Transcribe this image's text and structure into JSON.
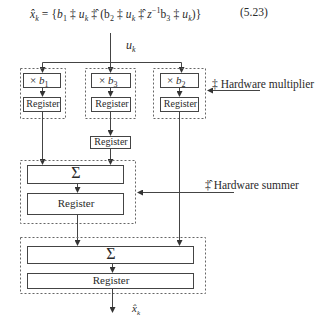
{
  "equation": {
    "lhs": "x̂",
    "lhs_sub": "k",
    "body_parts": [
      "{",
      "b",
      "1",
      " ‡ ",
      "u",
      "k",
      " ‡̂ (b",
      "2",
      " ‡ ",
      "u",
      "k",
      " ‡̂ ",
      "z",
      "−1",
      "b",
      "3",
      " ‡ ",
      "u",
      "k",
      ")}"
    ],
    "text": "x̂k = {b1 ‡ uk ‡̂ (b2 ‡ uk ‡̂ z−1b3 ‡ uk)}",
    "number": "(5.23)"
  },
  "diagram": {
    "input_label": "u",
    "input_sub": "k",
    "output_label": "x̂",
    "output_sub": "k",
    "multipliers": [
      {
        "op": "×",
        "coef": "b",
        "sub": "1",
        "register": "Register"
      },
      {
        "op": "×",
        "coef": "b",
        "sub": "3",
        "register": "Register",
        "extra_register": "Register"
      },
      {
        "op": "×",
        "coef": "b",
        "sub": "2",
        "register": "Register"
      }
    ],
    "summer1": {
      "symbol": "Σ",
      "register": "Register"
    },
    "summer2": {
      "symbol": "Σ",
      "register": "Register"
    },
    "annotations": {
      "multiplier": "‡ Hardware multiplier",
      "summer": "‡̂ Hardware summer"
    }
  }
}
